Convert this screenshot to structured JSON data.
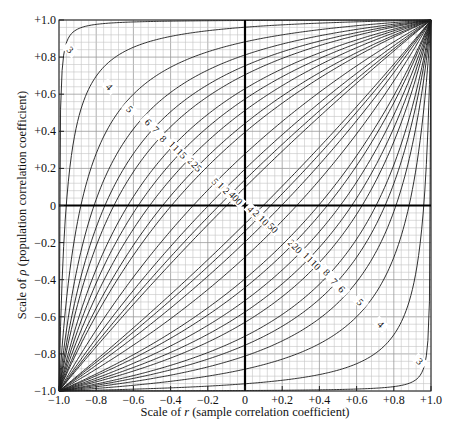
{
  "chart_data": {
    "type": "line",
    "title": "",
    "xlabel": "Scale of r (sample correlation coefficient)",
    "xlabel_parts": {
      "prefix": "Scale of ",
      "symbol": "r",
      "suffix": " (sample correlation coefficient)"
    },
    "ylabel": "Scale of ρ (population correlation coefficient)",
    "ylabel_parts": {
      "prefix": "Scale of ",
      "symbol": "ρ",
      "suffix": " (population correlation coefficient)"
    },
    "xlim": [
      -1.0,
      1.0
    ],
    "ylim": [
      -1.0,
      1.0
    ],
    "x_ticks": [
      "−1.0",
      "−0.8",
      "−0.6",
      "−0.4",
      "−0.2",
      "0",
      "+0.2",
      "+0.4",
      "+0.6",
      "+0.8",
      "+1.0"
    ],
    "y_ticks": [
      "+1.0",
      "+0.8",
      "+0.6",
      "+0.4",
      "+0.2",
      "0",
      "−0.2",
      "−0.4",
      "−0.6",
      "−0.8",
      "−1.0"
    ],
    "grid": {
      "on": true,
      "minor_step": 0.04,
      "major_step": 0.2
    },
    "confidence_level": 0.95,
    "series": [
      {
        "name": "3",
        "n": 3
      },
      {
        "name": "4",
        "n": 4
      },
      {
        "name": "5",
        "n": 5
      },
      {
        "name": "6",
        "n": 6
      },
      {
        "name": "7",
        "n": 7
      },
      {
        "name": "8",
        "n": 8
      },
      {
        "name": "10",
        "n": 10
      },
      {
        "name": "12",
        "n": 12
      },
      {
        "name": "15",
        "n": 15
      },
      {
        "name": "20",
        "n": 20
      },
      {
        "name": "25",
        "n": 25
      },
      {
        "name": "50",
        "n": 50
      },
      {
        "name": "100",
        "n": 100
      },
      {
        "name": "200",
        "n": 200
      },
      {
        "name": "400",
        "n": 400
      }
    ],
    "upper_labels": [
      {
        "text": "3",
        "x": -0.94,
        "y": 0.84
      },
      {
        "text": "4",
        "x": -0.73,
        "y": 0.64
      },
      {
        "text": "5",
        "x": -0.62,
        "y": 0.52
      },
      {
        "text": "6",
        "x": -0.52,
        "y": 0.45
      },
      {
        "text": "7",
        "x": -0.48,
        "y": 0.41
      },
      {
        "text": "8",
        "x": -0.44,
        "y": 0.36
      },
      {
        "text": "10",
        "x": -0.38,
        "y": 0.32
      },
      {
        "text": "12",
        "x": -0.36,
        "y": 0.3
      },
      {
        "text": "15",
        "x": -0.34,
        "y": 0.28
      },
      {
        "text": "20",
        "x": -0.28,
        "y": 0.23
      },
      {
        "text": "25",
        "x": -0.26,
        "y": 0.21
      },
      {
        "text": "50",
        "x": -0.15,
        "y": 0.12
      },
      {
        "text": "100",
        "x": -0.11,
        "y": 0.09
      },
      {
        "text": "200",
        "x": -0.08,
        "y": 0.06
      },
      {
        "text": "400",
        "x": -0.05,
        "y": 0.04
      }
    ],
    "lower_labels": [
      {
        "text": "400",
        "x": 0.05,
        "y": -0.04
      },
      {
        "text": "200",
        "x": 0.08,
        "y": -0.06
      },
      {
        "text": "100",
        "x": 0.11,
        "y": -0.09
      },
      {
        "text": "50",
        "x": 0.15,
        "y": -0.12
      },
      {
        "text": "25",
        "x": 0.26,
        "y": -0.21
      },
      {
        "text": "20",
        "x": 0.28,
        "y": -0.23
      },
      {
        "text": "15",
        "x": 0.34,
        "y": -0.28
      },
      {
        "text": "12",
        "x": 0.36,
        "y": -0.3
      },
      {
        "text": "10",
        "x": 0.38,
        "y": -0.32
      },
      {
        "text": "8",
        "x": 0.44,
        "y": -0.36
      },
      {
        "text": "7",
        "x": 0.48,
        "y": -0.41
      },
      {
        "text": "6",
        "x": 0.52,
        "y": -0.45
      },
      {
        "text": "5",
        "x": 0.62,
        "y": -0.52
      },
      {
        "text": "4",
        "x": 0.73,
        "y": -0.64
      },
      {
        "text": "3",
        "x": 0.94,
        "y": -0.84
      }
    ]
  }
}
